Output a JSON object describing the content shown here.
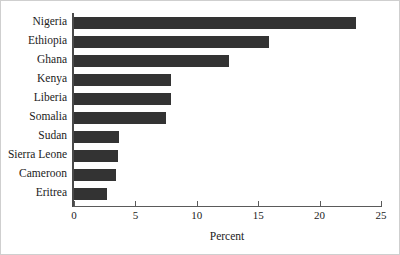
{
  "chart_data": {
    "type": "bar",
    "orientation": "horizontal",
    "title": "",
    "xlabel": "Percent",
    "ylabel": "",
    "categories": [
      "Nigeria",
      "Ethiopia",
      "Ghana",
      "Kenya",
      "Liberia",
      "Somalia",
      "Sudan",
      "Sierra Leone",
      "Cameroon",
      "Eritrea"
    ],
    "values": [
      23.0,
      15.9,
      12.6,
      7.9,
      7.9,
      7.5,
      3.7,
      3.6,
      3.4,
      2.7
    ],
    "xlim": [
      0,
      25
    ],
    "xticks": [
      0,
      5,
      10,
      15,
      20,
      25
    ],
    "xtick_labels": [
      "0",
      "5",
      "10",
      "15",
      "20",
      "25"
    ],
    "grid": false,
    "legend": false,
    "bar_color": "#333333",
    "axis_color": "#4a4a4a",
    "background_color": "#ffffff"
  }
}
